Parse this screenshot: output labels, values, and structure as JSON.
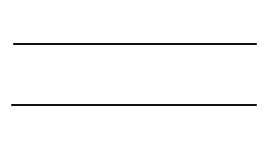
{
  "diagram": {
    "top_plate": {
      "label": "ε",
      "subscript": "1",
      "hatch_side": "above"
    },
    "bottom_plate": {
      "label": "ε",
      "subscript": "2",
      "hatch_side": "below"
    },
    "colors": {
      "line": "#111111",
      "background": "#ffffff"
    }
  }
}
